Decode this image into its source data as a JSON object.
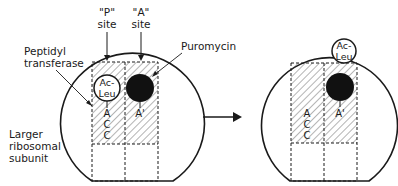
{
  "labels": {
    "p_site_line1": "\"P\"",
    "p_site_line2": "site",
    "a_site_line1": "\"A\"",
    "a_site_line2": "site",
    "peptidyl_line1": "Peptidyl",
    "peptidyl_line2": "transferase",
    "puromycin": "Puromycin",
    "subunit_line1": "Larger",
    "subunit_line2": "ribosomal",
    "subunit_line3": "subunit"
  },
  "before": {
    "acleu_line1": "Ac-",
    "acleu_line2": "Leu",
    "p_trna": [
      "A",
      "C",
      "C"
    ],
    "a_trna": "A'"
  },
  "after": {
    "acleu_line1": "Ac-",
    "acleu_line2": "Leu",
    "p_trna": [
      "A",
      "C",
      "C"
    ],
    "a_trna": "A'"
  },
  "colors": {
    "ink": "#1a1a1a",
    "background": "#ffffff"
  }
}
